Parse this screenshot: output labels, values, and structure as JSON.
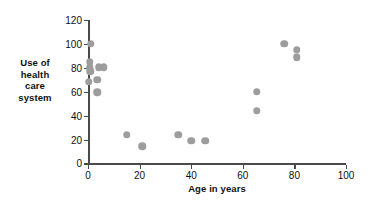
{
  "chart_data": {
    "type": "scatter",
    "title": "",
    "xlabel": "Age in years",
    "ylabel": "Use of health care system",
    "ylabel_lines": [
      "Use of",
      "health",
      "care",
      "system"
    ],
    "xlim": [
      0,
      100
    ],
    "ylim": [
      0,
      120
    ],
    "xticks": [
      0,
      20,
      40,
      60,
      80,
      100
    ],
    "yticks": [
      0,
      20,
      40,
      60,
      80,
      100,
      120
    ],
    "xticklabels": [
      "0",
      "20",
      "40",
      "60",
      "80",
      "100"
    ],
    "yticklabels": [
      "0",
      "20",
      "40",
      "60",
      "80",
      "100",
      "120"
    ],
    "grid": false,
    "legend": null,
    "marker_color": "#9d9d9d",
    "axis_color": "#4a4a4a",
    "points": [
      {
        "x": 1.0,
        "y": 100.0
      },
      {
        "x": 0.6,
        "y": 85.0
      },
      {
        "x": 0.6,
        "y": 80.5
      },
      {
        "x": 0.8,
        "y": 77.0
      },
      {
        "x": 0.2,
        "y": 68.5
      },
      {
        "x": 4.2,
        "y": 80.5
      },
      {
        "x": 6.2,
        "y": 80.5
      },
      {
        "x": 3.6,
        "y": 70.0
      },
      {
        "x": 3.6,
        "y": 59.5
      },
      {
        "x": 15.0,
        "y": 24.0
      },
      {
        "x": 21.0,
        "y": 14.5
      },
      {
        "x": 35.0,
        "y": 24.0
      },
      {
        "x": 40.0,
        "y": 19.0
      },
      {
        "x": 45.5,
        "y": 19.0
      },
      {
        "x": 65.5,
        "y": 60.0
      },
      {
        "x": 65.5,
        "y": 44.0
      },
      {
        "x": 76.0,
        "y": 100.0
      },
      {
        "x": 81.0,
        "y": 95.0
      },
      {
        "x": 81.0,
        "y": 89.0
      }
    ]
  }
}
